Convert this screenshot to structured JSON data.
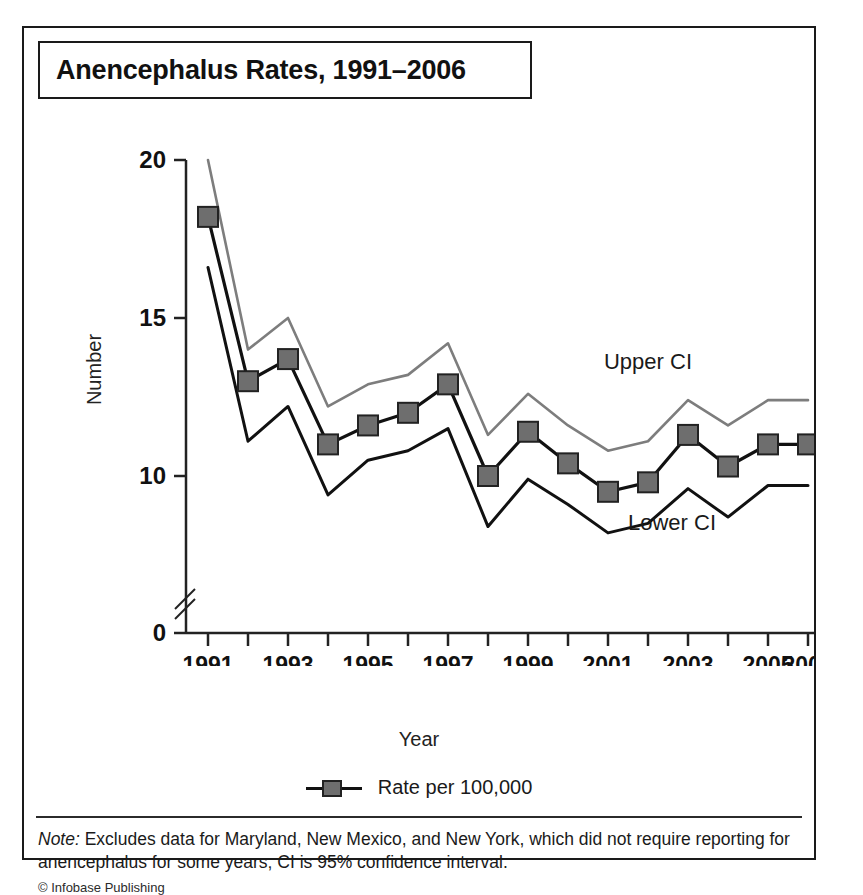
{
  "figure": {
    "title": "Anencephalus Rates, 1991–2006",
    "note_label": "Note:",
    "note_text": " Excludes data for Maryland, New Mexico, and New York, which did not require reporting for anencephalus for some years; CI is 95% confidence interval.",
    "copyright": "© Infobase Publishing"
  },
  "legend": {
    "series_label": "Rate per 100,000",
    "swatch_icon": "line-with-square-marker-icon"
  },
  "colors": {
    "rate_line": "#111111",
    "rate_marker_fill": "#6e6e6e",
    "rate_marker_stroke": "#222222",
    "upper_ci_line": "#7d7d7d",
    "lower_ci_line": "#111111",
    "axis": "#222222",
    "background": "#ffffff",
    "frame": "#1a1a1a"
  },
  "chart_data": {
    "type": "line",
    "title": "Anencephalus Rates, 1991–2006",
    "xlabel": "Year",
    "ylabel": "Number",
    "x": [
      1991,
      1992,
      1993,
      1994,
      1995,
      1996,
      1997,
      1998,
      1999,
      2000,
      2001,
      2002,
      2003,
      2004,
      2005,
      2006
    ],
    "xtick_labels": [
      "1991",
      "",
      "1993",
      "",
      "1995",
      "",
      "1997",
      "",
      "1999",
      "",
      "2001",
      "",
      "2003",
      "",
      "2005",
      "2006"
    ],
    "xtick_labels_shown": [
      "1991",
      "1993",
      "1995",
      "1997",
      "1999",
      "2001",
      "2003",
      "2005",
      "2006"
    ],
    "ytick_labels": [
      "0",
      "10",
      "15",
      "20"
    ],
    "ytick_values": [
      0,
      10,
      15,
      20
    ],
    "ylim": [
      0,
      20
    ],
    "axis_break": true,
    "axis_break_between": [
      0,
      10
    ],
    "grid": false,
    "legend_position": "below-plot-center",
    "annotations": [
      {
        "text": "Upper CI",
        "x": 2002,
        "y": 13.4
      },
      {
        "text": "Lower CI",
        "x": 2002.6,
        "y": 8.3
      }
    ],
    "series": [
      {
        "name": "Rate per 100,000",
        "style": "line-with-square-markers",
        "color": "#111111",
        "values": [
          18.2,
          13.0,
          13.7,
          11.0,
          11.6,
          12.0,
          12.9,
          10.0,
          11.4,
          10.4,
          9.5,
          9.8,
          11.3,
          10.3,
          11.0,
          11.0
        ]
      },
      {
        "name": "Upper CI",
        "style": "line",
        "color": "#7d7d7d",
        "values": [
          20.0,
          14.0,
          15.0,
          12.2,
          12.9,
          13.2,
          14.2,
          11.3,
          12.6,
          11.6,
          10.8,
          11.1,
          12.4,
          11.6,
          12.4,
          12.4
        ]
      },
      {
        "name": "Lower CI",
        "style": "line",
        "color": "#111111",
        "values": [
          16.6,
          11.1,
          12.2,
          9.4,
          10.5,
          10.8,
          11.5,
          8.4,
          9.9,
          9.1,
          8.2,
          8.5,
          9.6,
          8.7,
          9.7,
          9.7
        ]
      }
    ]
  }
}
